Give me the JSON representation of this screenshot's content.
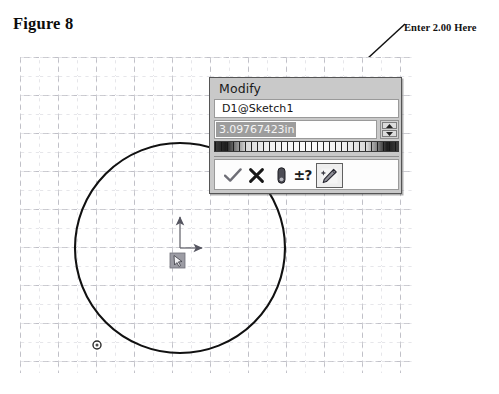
{
  "page": {
    "cutoff_text_top": "",
    "figure_caption": "Figure 8"
  },
  "annotation": {
    "label": "Enter 2.00 Here",
    "arrow_name": "callout-arrow"
  },
  "sketch": {
    "grid": {
      "major_spacing_px": 38,
      "minor_divisions": 2,
      "color": "#b4b4bc",
      "style": "dashed"
    },
    "circle": {
      "center_x_px": 160,
      "center_y_px": 191,
      "radius_px": 105,
      "stroke": "#111111",
      "stroke_width_px": 2
    },
    "point_marker": {
      "x_px": 97,
      "y_px": 288,
      "label": "sketch-point"
    },
    "origin": {
      "x_px": 160,
      "y_px": 191,
      "x_axis_label": "X",
      "y_axis_label": "Y"
    },
    "cursor": {
      "x_px": 156,
      "y_px": 199,
      "glyph": "pointer-select"
    }
  },
  "modify_dialog": {
    "title": "Modify",
    "name_field": {
      "value": "D1@Sketch1",
      "placeholder": "D1@Sketch1"
    },
    "value_field": {
      "value": "3.09767423in",
      "placeholder": "0.00in",
      "selected": true,
      "highlight_color": "#9d9d9d"
    },
    "spinner": {
      "up_label": "increase-value",
      "down_label": "decrease-value"
    },
    "thumbwheel": {
      "label": "value-thumbwheel"
    },
    "buttons": [
      {
        "name": "accept-button",
        "icon": "checkmark-icon",
        "title": "Save current value and exit the dialog"
      },
      {
        "name": "cancel-button",
        "icon": "x-cross-icon",
        "title": "Restore original value and exit the dialog"
      },
      {
        "name": "pin-button",
        "icon": "thumbtack-pin-icon",
        "title": "Keep the dialog open after accepting"
      },
      {
        "name": "tolerance-button",
        "icon": "plus-minus-question-icon",
        "label": "±?",
        "title": "Display or change tolerance / precision"
      },
      {
        "name": "rebuild-button",
        "icon": "rebuild-wand-icon",
        "title": "Rebuild the model with the new value"
      }
    ]
  },
  "colors": {
    "dialog_face": "#c9c9c9",
    "dialog_border": "#555555",
    "field_bg": "#ffffff",
    "grid_line": "#b4b4bc",
    "geometry": "#111111",
    "selection": "#9d9d9d"
  }
}
